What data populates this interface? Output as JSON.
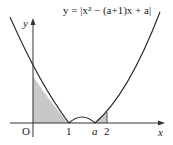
{
  "diagram": {
    "equation": "y = |x² − (a+1)x + a|",
    "axes": {
      "x_label": "x",
      "y_label": "y",
      "origin_label": "O"
    },
    "x_ticks": [
      {
        "label": "1",
        "italic": false
      },
      {
        "label": "a",
        "italic": true
      },
      {
        "label": "2",
        "italic": false
      }
    ],
    "shaded_regions": [
      "0 ≤ x ≤ 1 under curve",
      "a ≤ x ≤ 2 under curve"
    ],
    "colors": {
      "curve": "#222222",
      "shade": "#c8c8c8",
      "axis": "#333333"
    }
  }
}
